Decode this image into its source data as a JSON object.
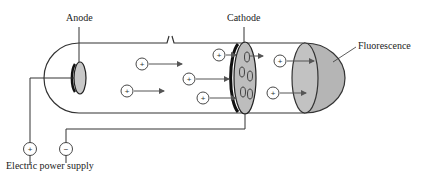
{
  "labels": {
    "anode": "Anode",
    "cathode": "Cathode",
    "fluorescence": "Fluorescence",
    "power_supply": "Electric power supply"
  },
  "terminals": {
    "positive": "+",
    "negative": "−"
  },
  "particles": [
    {
      "x": 142,
      "y": 64,
      "sign": "+"
    },
    {
      "x": 127,
      "y": 91,
      "sign": "+"
    },
    {
      "x": 189,
      "y": 79,
      "sign": "+"
    },
    {
      "x": 203,
      "y": 98,
      "sign": "+"
    },
    {
      "x": 219,
      "y": 55,
      "sign": "+"
    },
    {
      "x": 280,
      "y": 61,
      "sign": "+"
    },
    {
      "x": 273,
      "y": 93,
      "sign": "+"
    }
  ],
  "colors": {
    "line": "#333333",
    "fill_gray": "#b8b8b8",
    "arrow": "#555555"
  }
}
